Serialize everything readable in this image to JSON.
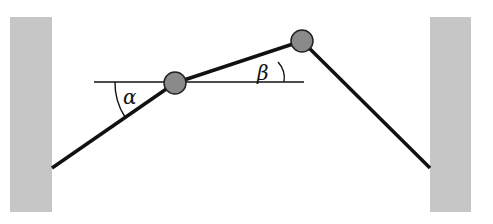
{
  "diagram": {
    "labels": {
      "alpha": "α",
      "beta": "β"
    },
    "colors": {
      "wall": "#c4c4c4",
      "rope": "#111111",
      "ball": "#8a8a8a",
      "background": "#ffffff"
    }
  }
}
